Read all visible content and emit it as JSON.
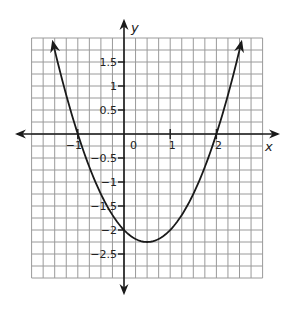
{
  "chart_data": {
    "type": "line",
    "title": "",
    "xlabel": "x",
    "ylabel": "y",
    "xlim": [
      -2,
      3
    ],
    "ylim": [
      -3,
      2
    ],
    "grid": true,
    "grid_step_x": 0.25,
    "grid_step_y": 0.25,
    "x_ticks": [
      {
        "value": -1,
        "label": "-1"
      },
      {
        "value": 1,
        "label": "1"
      },
      {
        "value": 2,
        "label": "2"
      }
    ],
    "origin_label": "0",
    "y_ticks": [
      {
        "value": 1.5,
        "label": "1.5"
      },
      {
        "value": 1,
        "label": "1"
      },
      {
        "value": 0.5,
        "label": "0.5"
      },
      {
        "value": -0.5,
        "label": "-0.5"
      },
      {
        "value": -1,
        "label": "-1"
      },
      {
        "value": -1.5,
        "label": "-1.5"
      },
      {
        "value": -2,
        "label": "-2"
      },
      {
        "value": -2.5,
        "label": "-2.5"
      }
    ],
    "series": [
      {
        "name": "y = x^2 - x - 2",
        "equation": "y = (x + 1)(x - 2)",
        "x_range": [
          -1.54,
          2.54
        ],
        "x_intercepts": [
          -1,
          2
        ],
        "y_intercept": -2,
        "vertex": [
          0.5,
          -2.25
        ],
        "arrows_at_ends": true
      }
    ],
    "legend": null
  },
  "colors": {
    "grid": "#9a9a9a",
    "axis": "#1a1a1a",
    "curve": "#1a1a1a",
    "background": "#ffffff"
  }
}
